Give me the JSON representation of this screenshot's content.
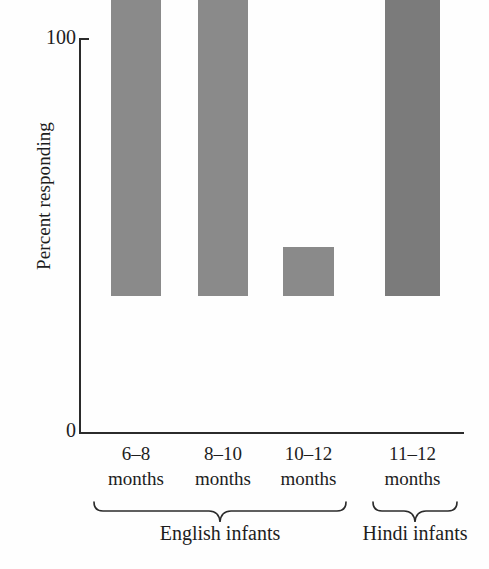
{
  "chart_data": {
    "type": "bar",
    "title": "",
    "subtitle": "",
    "xlabel": "",
    "ylabel": "Percent responding",
    "ylim": [
      0,
      100
    ],
    "y_ticks": [
      0,
      100
    ],
    "y_tick_labels": [
      "0",
      "100"
    ],
    "grid": false,
    "legend": null,
    "categories": [
      "6–8 months",
      "8–10 months",
      "10–12 months",
      "11–12 months"
    ],
    "values": [
      96,
      77,
      12,
      96
    ],
    "bar_colors": [
      "#8a8a8a",
      "#8a8a8a",
      "#8a8a8a",
      "#7b7b7b"
    ],
    "groups": [
      {
        "label": "English infants",
        "category_indices": [
          0,
          1,
          2
        ]
      },
      {
        "label": "Hindi infants",
        "category_indices": [
          3
        ]
      }
    ]
  },
  "axes": {
    "y_title": "Percent responding",
    "y_top_label": "100",
    "y_bottom_label": "0",
    "axis_color": "#2b2b2b"
  },
  "bars": [
    {
      "id": "bar-6-8-months",
      "label_line1": "6–8",
      "label_line2": "months",
      "value": 96,
      "color": "#8a8a8a",
      "left": 111,
      "width": 50,
      "height": 380
    },
    {
      "id": "bar-8-10-months",
      "label_line1": "8–10",
      "label_line2": "months",
      "value": 77,
      "color": "#8a8a8a",
      "left": 198,
      "width": 50,
      "height": 303
    },
    {
      "id": "bar-10-12-months",
      "label_line1": "10–12",
      "label_line2": "months",
      "value": 12,
      "color": "#8a8a8a",
      "left": 283,
      "width": 51,
      "height": 49
    },
    {
      "id": "bar-11-12-months",
      "label_line1": "11–12",
      "label_line2": "months",
      "value": 96,
      "color": "#7b7b7b",
      "left": 385,
      "width": 55,
      "height": 380
    }
  ],
  "groups": {
    "english": {
      "label": "English infants"
    },
    "hindi": {
      "label": "Hindi infants"
    }
  },
  "icons": {
    "brace_english": "curly-brace-icon",
    "brace_hindi": "curly-brace-icon"
  }
}
